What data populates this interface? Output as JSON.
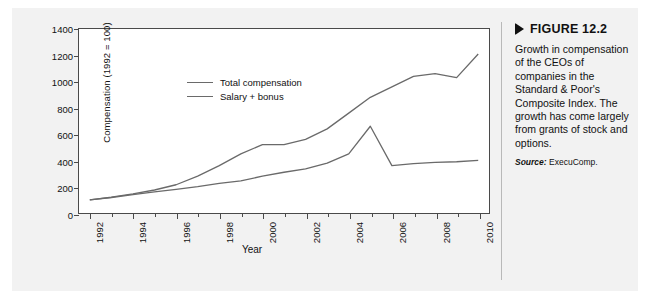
{
  "figure": {
    "caption_title": "FIGURE 12.2",
    "caption_body": "Growth in compensation of the CEOs of companies in the Standard & Poor's Composite Index. The growth has come largely from grants of stock and options.",
    "source_label": "Source:",
    "source_value": "ExecuComp."
  },
  "chart_data": {
    "type": "line",
    "title": "",
    "xlabel": "Year",
    "ylabel": "Compensation (1992 = 100)",
    "x": [
      1992,
      1993,
      1994,
      1995,
      1996,
      1997,
      1998,
      1999,
      2000,
      2001,
      2002,
      2003,
      2004,
      2005,
      2006,
      2007,
      2008,
      2009,
      2010
    ],
    "xlim": [
      1991.5,
      2010.5
    ],
    "ylim": [
      0,
      1400
    ],
    "yticks": [
      0,
      200,
      400,
      600,
      800,
      1000,
      1200,
      1400
    ],
    "xticks": [
      1992,
      1994,
      1996,
      1998,
      2000,
      2002,
      2004,
      2006,
      2008,
      2010
    ],
    "xtick_labels": [
      "1992",
      "1994",
      "1996",
      "1998",
      "2000",
      "2002",
      "2004",
      "2006",
      "2008",
      "2010"
    ],
    "grid": false,
    "legend_position": "upper left",
    "series": [
      {
        "name": "Total compensation",
        "color": "#6a6a6a",
        "values": [
          100,
          120,
          145,
          175,
          215,
          280,
          360,
          450,
          520,
          520,
          560,
          640,
          760,
          880,
          960,
          1040,
          1060,
          1030,
          1210
        ]
      },
      {
        "name": "Salary + bonus",
        "color": "#6a6a6a",
        "values": [
          100,
          118,
          140,
          160,
          180,
          200,
          225,
          245,
          280,
          310,
          335,
          380,
          450,
          660,
          360,
          375,
          385,
          390,
          400
        ]
      }
    ]
  }
}
